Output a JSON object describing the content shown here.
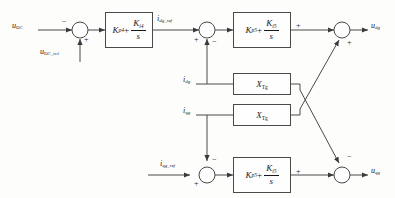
{
  "diagram": {
    "colors": {
      "line": "#4a4a4a",
      "text": "#1a1a1a",
      "background": "#fdfdfb",
      "block_fill": "#fefefe"
    },
    "inputs": {
      "udc": "u",
      "udc_sub": "DC",
      "udc_ref": "u",
      "udc_ref_sub": "DC_ref",
      "idg_ref": "i",
      "idg_ref_sub": "dg_ref",
      "idg": "i",
      "idg_sub": "dg",
      "iqg": "i",
      "iqg_sub": "qg",
      "iqg_ref": "i",
      "iqg_ref_sub": "qg_ref"
    },
    "outputs": {
      "udg": "u",
      "udg_sub": "dg",
      "uqg": "u",
      "uqg_sub": "qg"
    },
    "blocks": [
      {
        "id": "pi-dc",
        "kind": "pi-controller",
        "kp": "K",
        "kp_sub": "p4",
        "ki": "K",
        "ki_sub": "i4",
        "denominator": "s"
      },
      {
        "id": "pi-d-axis",
        "kind": "pi-controller",
        "kp": "K",
        "kp_sub": "p5",
        "ki": "K",
        "ki_sub": "i5",
        "denominator": "s"
      },
      {
        "id": "reactance-upper",
        "kind": "gain",
        "label": "X",
        "label_sub": "Tg"
      },
      {
        "id": "reactance-lower",
        "kind": "gain",
        "label": "X",
        "label_sub": "Tg"
      },
      {
        "id": "pi-q-axis",
        "kind": "pi-controller",
        "kp": "K",
        "kp_sub": "p5",
        "ki": "K",
        "ki_sub": "i5",
        "denominator": "s"
      }
    ],
    "summing_junctions": [
      {
        "id": "sum-dc",
        "signs": {
          "left": "−",
          "bottom": "+"
        }
      },
      {
        "id": "sum-d-current",
        "signs": {
          "left": "+",
          "bottom": "−"
        }
      },
      {
        "id": "sum-d-output",
        "signs": {
          "left": "+",
          "diagonal": "+"
        }
      },
      {
        "id": "sum-q-current",
        "signs": {
          "left": "+",
          "top": "−"
        }
      },
      {
        "id": "sum-q-output",
        "signs": {
          "left": "+",
          "diagonal": "−"
        }
      }
    ]
  }
}
